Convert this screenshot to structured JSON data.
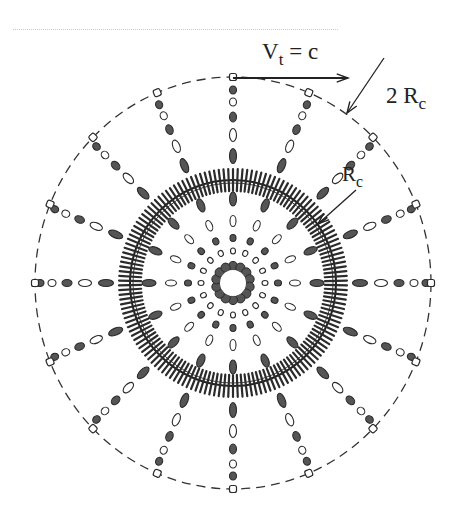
{
  "diagram": {
    "title_rule": "faint dotted rule",
    "center": {
      "x": 233,
      "y": 283
    },
    "spoke_count": 16,
    "outer_circle": {
      "rx": 198,
      "ry": 206,
      "style": "dashed",
      "label": "2R_c"
    },
    "comb_ring": {
      "r": 103,
      "teeth": 150,
      "tooth_len": 11,
      "label": "R_c"
    },
    "inner_ring": {
      "r": 17,
      "beads": 14
    },
    "spoke_beads": [
      {
        "r": 193,
        "type": "dark",
        "w": 6,
        "h": 7
      },
      {
        "r": 181,
        "type": "light",
        "w": 6,
        "h": 7
      },
      {
        "r": 166,
        "type": "dark",
        "w": 6,
        "h": 9
      },
      {
        "r": 148,
        "type": "light",
        "w": 6,
        "h": 12
      },
      {
        "r": 127,
        "type": "dark",
        "w": 6,
        "h": 14
      },
      {
        "r": 84,
        "type": "dark",
        "w": 6,
        "h": 13
      },
      {
        "r": 62,
        "type": "light",
        "w": 5,
        "h": 10
      },
      {
        "r": 45,
        "type": "dark",
        "w": 5,
        "h": 6
      },
      {
        "r": 32,
        "type": "light",
        "w": 4,
        "h": 5
      }
    ],
    "colors": {
      "dark": "#555555",
      "stroke": "#2a2a2a",
      "light": "#ffffff"
    },
    "annotations": {
      "velocity": {
        "V": "V",
        "sub": "t",
        "rest": " = c"
      },
      "outer": {
        "pre": "2 R",
        "sub": "c"
      },
      "inner": {
        "pre": "R",
        "sub": "c"
      }
    }
  }
}
